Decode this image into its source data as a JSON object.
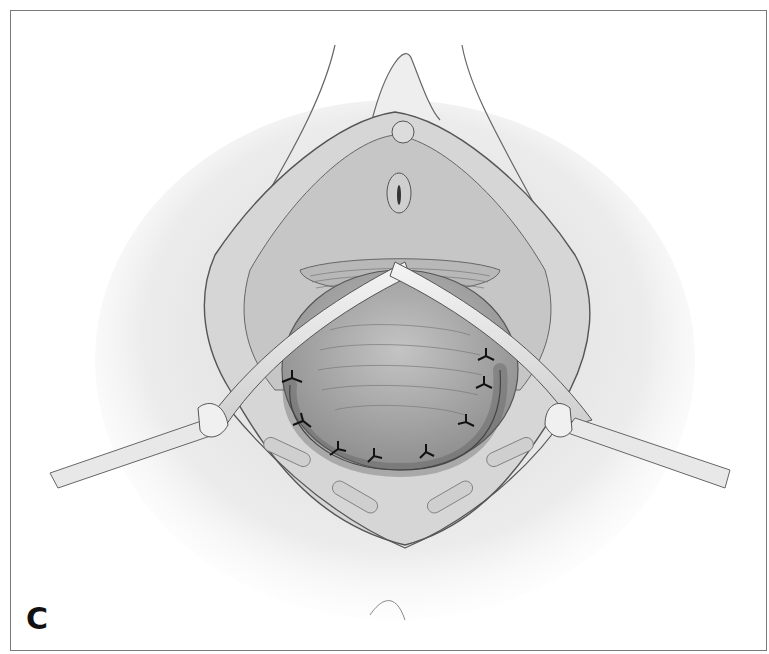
{
  "figure": {
    "panel_label": "C",
    "colors": {
      "frame": "#7a7a7a",
      "outline": "#555555",
      "tissue_light": "#dedede",
      "tissue_mid": "#bdbdbd",
      "tissue_dark": "#9a9a9a",
      "suture": "#111111"
    },
    "elements": {
      "sutures_count": 9,
      "retractors_count": 2
    }
  }
}
